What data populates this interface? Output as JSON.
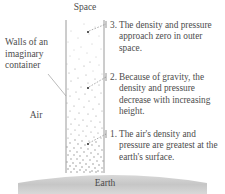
{
  "diagram": {
    "title_top": "Space",
    "title_bottom": "Earth",
    "left_labels": {
      "walls": "Walls of an imaginary container",
      "air": "Air"
    },
    "callouts": [
      {
        "number": "1.",
        "text": "The air's density and pressure are greatest at the earth's surface."
      },
      {
        "number": "2.",
        "text": "Because of gravity, the density and pressure decrease with increasing height."
      },
      {
        "number": "3.",
        "text": "The density and pressure approach zero in outer space."
      }
    ],
    "colors": {
      "text": "#4d4d4d",
      "wall_line": "#9a9a9a",
      "ground_fill": "#c9c9c9",
      "dot": "#8d8d8d",
      "background": "#ffffff"
    },
    "column": {
      "left_wall_x": 66,
      "right_wall_x": 104,
      "top_y": 20,
      "bottom_y": 173,
      "description": "air column with dot density increasing downward"
    }
  }
}
